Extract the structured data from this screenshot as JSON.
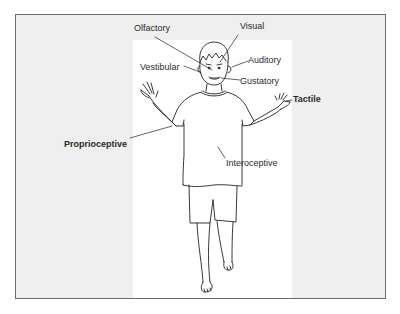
{
  "diagram": {
    "type": "labeled-figure",
    "labels": [
      {
        "id": "olfactory",
        "text": "Olfactory"
      },
      {
        "id": "visual",
        "text": "Visual"
      },
      {
        "id": "auditory",
        "text": "Auditory"
      },
      {
        "id": "vestibular",
        "text": "Vestibular"
      },
      {
        "id": "gustatory",
        "text": "Gustatory"
      },
      {
        "id": "tactile",
        "text": "Tactile"
      },
      {
        "id": "proprioceptive",
        "text": "Proprioceptive"
      },
      {
        "id": "interoceptive",
        "text": "Interoceptive"
      }
    ],
    "colors": {
      "frame_border": "#6b6b6b",
      "frame_background": "#efefef",
      "panel_background": "#ffffff",
      "line": "#222222",
      "text": "#2a2a2a"
    }
  }
}
